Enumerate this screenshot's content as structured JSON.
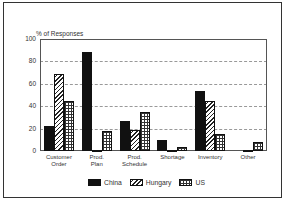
{
  "chart_data": {
    "type": "bar",
    "title": "",
    "ylabel": "% of Responses",
    "xlabel": "",
    "ylim": [
      0,
      100
    ],
    "yticks": [
      0,
      20,
      40,
      60,
      80,
      100
    ],
    "grid": true,
    "legend_position": "bottom",
    "categories": [
      "Customer Order",
      "Prod. Plan",
      "Prod. Schedule",
      "Shortage",
      "Inventory",
      "Other"
    ],
    "category_lines": [
      [
        "Customer",
        "Order"
      ],
      [
        "Prod.",
        "Plan"
      ],
      [
        "Prod.",
        "Schedule"
      ],
      [
        "Shortage"
      ],
      [
        "Inventory"
      ],
      [
        "Other"
      ]
    ],
    "series": [
      {
        "name": "China",
        "pattern": "solid",
        "values": [
          22,
          88,
          27,
          10,
          54,
          0
        ]
      },
      {
        "name": "Hungary",
        "pattern": "diagonal-hatch",
        "values": [
          69,
          0.5,
          19,
          0.5,
          45,
          0.5
        ]
      },
      {
        "name": "US",
        "pattern": "grid-hatch",
        "values": [
          45,
          18,
          35,
          4,
          15,
          8
        ]
      }
    ]
  },
  "labels": {
    "ylabel": "% of Responses",
    "yticks": [
      "100",
      "80",
      "60",
      "40",
      "20",
      "0"
    ],
    "legend": [
      "China",
      "Hungary",
      "US"
    ]
  }
}
